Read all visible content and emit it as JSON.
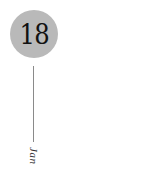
{
  "date_marker": {
    "day": "18",
    "month": "Jan"
  },
  "colors": {
    "circle": "#b9b9b9",
    "day_text": "#111111",
    "line": "#8a8a8a",
    "month_text": "#333333"
  }
}
